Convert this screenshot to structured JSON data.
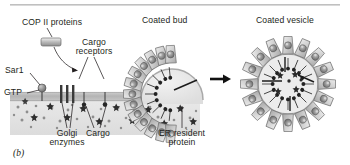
{
  "figure": {
    "panel_letter": "(b)",
    "title_rule": true,
    "background_color": "#ffffff",
    "ink_color": "#231f20"
  },
  "labels": {
    "cop2": "COP II  proteins",
    "cargo_receptors_line1": "Cargo",
    "cargo_receptors_line2": "receptors",
    "sar1": "Sar1",
    "gtp": "GTP",
    "golgi_enzymes_line1": "Golgi",
    "golgi_enzymes_line2": "enzymes",
    "cargo": "Cargo",
    "er_resident_line1": "ER resident",
    "er_resident_line2": "protein",
    "coated_bud": "Coated bud",
    "coated_vesicle": "Coated vesicle"
  },
  "colors": {
    "membrane": "#bdbdbd",
    "lumen": "#e3e3e3",
    "coat_fill": "#d2d2d2",
    "coat_stroke": "#6e6e6e",
    "cargo_dark": "#2e2e2e",
    "receptor_blob": "#8c8c8c",
    "vesicle_lumen": "#ececec",
    "arrow": "#111111",
    "rule": "#b5b5b5"
  },
  "diagram": {
    "type": "cell-biology-schematic",
    "stages": [
      "Coated bud",
      "Coated vesicle"
    ],
    "coated_bud": {
      "coat_segments": 13,
      "orientation": "dome-up"
    },
    "coated_vesicle": {
      "coat_segments": 16,
      "orientation": "full-circle"
    },
    "membrane": {
      "x_start": 10,
      "x_end": 200,
      "y": 92,
      "thickness": 9
    },
    "golgi_enzyme_bars": 3,
    "transport_arrow": "right"
  }
}
